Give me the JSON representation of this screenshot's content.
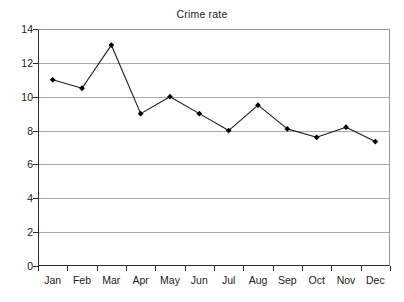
{
  "chart_data": {
    "type": "line",
    "title": "Crime rate",
    "xlabel": "",
    "ylabel": "",
    "categories": [
      "Jan",
      "Feb",
      "Mar",
      "Apr",
      "May",
      "Jun",
      "Jul",
      "Aug",
      "Sep",
      "Oct",
      "Nov",
      "Dec"
    ],
    "values": [
      11.0,
      10.5,
      13.05,
      9.0,
      10.0,
      9.0,
      8.0,
      9.5,
      8.1,
      7.6,
      8.2,
      7.35
    ],
    "series": [
      {
        "name": "Crime rate",
        "values": [
          11.0,
          10.5,
          13.05,
          9.0,
          10.0,
          9.0,
          8.0,
          9.5,
          8.1,
          7.6,
          8.2,
          7.35
        ]
      }
    ],
    "ylim": [
      0,
      14
    ],
    "y_ticks": [
      0,
      2,
      4,
      6,
      8,
      10,
      12,
      14
    ],
    "y_tick_labels": [
      "0",
      "2",
      "4",
      "6",
      "8",
      "10",
      "12",
      "14"
    ],
    "grid": true,
    "grid_axis": "y",
    "legend": false,
    "legend_position": "none",
    "marker": "diamond",
    "line_color": "#1a1a1a",
    "marker_color": "#000000",
    "grid_color": "#a8a8a8",
    "axis_color": "#2b2b2b",
    "background_color": "#ffffff"
  }
}
